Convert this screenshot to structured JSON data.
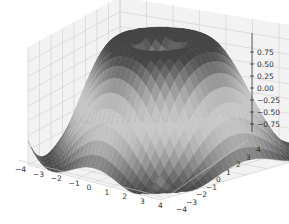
{
  "chart_data": {
    "type": "surface3d",
    "title": "",
    "function": "z = sin(sqrt(x^2 + y^2))",
    "colormap": "gray",
    "x": {
      "label": "",
      "range": [
        -4,
        4
      ],
      "ticks": [
        "−4",
        "−3",
        "−2",
        "−1",
        "0",
        "1",
        "2",
        "3",
        "4"
      ]
    },
    "y": {
      "label": "",
      "range": [
        -4,
        4
      ],
      "ticks": [
        "−4",
        "−3",
        "−2",
        "−1",
        "0",
        "1",
        "2",
        "3",
        "4"
      ]
    },
    "z": {
      "label": "",
      "range": [
        -1,
        1
      ],
      "ticks": [
        "0.75",
        "0.50",
        "0.25",
        "0.00",
        "−0.25",
        "−0.50",
        "−0.75"
      ]
    },
    "grid": true,
    "legend": null,
    "view": {
      "elev": 30,
      "azim": -60
    }
  }
}
